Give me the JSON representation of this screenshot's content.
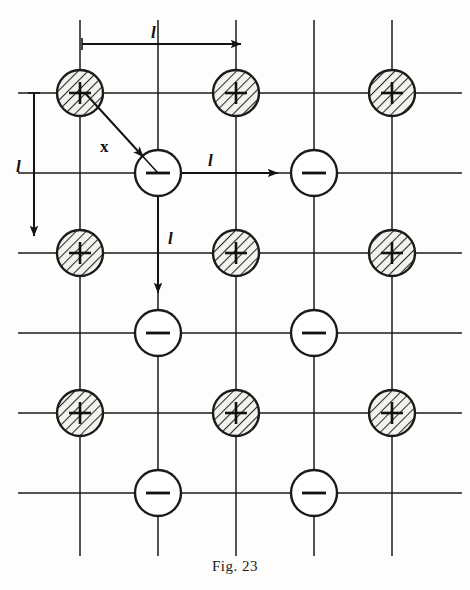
{
  "figure": {
    "caption": "Fig. 23",
    "background_color": "#fdfdfb",
    "line_color": "#1a1a1a",
    "hatch_color": "#2b2b2b",
    "ion_fill_positive": "#e8e8e4",
    "ion_fill_negative": "#ffffff"
  },
  "lattice": {
    "columns_x": [
      80,
      158,
      236,
      314,
      392
    ],
    "rows_y": [
      93,
      173,
      253,
      333,
      413,
      493
    ],
    "spacing_label": "l",
    "circle_radius": 23,
    "ions": [
      {
        "col": 0,
        "row": 0,
        "charge": "+",
        "symbol": "+",
        "shaded": true
      },
      {
        "col": 2,
        "row": 0,
        "charge": "+",
        "symbol": "+",
        "shaded": true
      },
      {
        "col": 4,
        "row": 0,
        "charge": "+",
        "symbol": "+",
        "shaded": true
      },
      {
        "col": 1,
        "row": 1,
        "charge": "-",
        "symbol": "−",
        "shaded": false
      },
      {
        "col": 3,
        "row": 1,
        "charge": "-",
        "symbol": "−",
        "shaded": false
      },
      {
        "col": 0,
        "row": 2,
        "charge": "+",
        "symbol": "+",
        "shaded": true
      },
      {
        "col": 2,
        "row": 2,
        "charge": "+",
        "symbol": "+",
        "shaded": true
      },
      {
        "col": 4,
        "row": 2,
        "charge": "+",
        "symbol": "+",
        "shaded": true
      },
      {
        "col": 1,
        "row": 3,
        "charge": "-",
        "symbol": "−",
        "shaded": false
      },
      {
        "col": 3,
        "row": 3,
        "charge": "-",
        "symbol": "−",
        "shaded": false
      },
      {
        "col": 0,
        "row": 4,
        "charge": "+",
        "symbol": "+",
        "shaded": true
      },
      {
        "col": 2,
        "row": 4,
        "charge": "+",
        "symbol": "+",
        "shaded": true
      },
      {
        "col": 4,
        "row": 4,
        "charge": "+",
        "symbol": "+",
        "shaded": true
      },
      {
        "col": 1,
        "row": 5,
        "charge": "-",
        "symbol": "−",
        "shaded": false
      },
      {
        "col": 3,
        "row": 5,
        "charge": "-",
        "symbol": "−",
        "shaded": false
      }
    ]
  },
  "annotations": {
    "top_arrow": {
      "label": "l",
      "label_x": 151,
      "label_y": 24,
      "x1": 82,
      "y1": 44,
      "x2": 241,
      "y2": 44,
      "direction": "right"
    },
    "left_arrow": {
      "label": "l",
      "label_x": 16,
      "label_y": 158,
      "x1": 34,
      "y1": 93,
      "x2": 34,
      "y2": 236,
      "direction": "down"
    },
    "middle_right_arrow": {
      "label": "l",
      "label_x": 208,
      "label_y": 152,
      "x1": 182,
      "y1": 173,
      "x2": 278,
      "y2": 173,
      "direction": "right"
    },
    "middle_down_arrow": {
      "label": "l",
      "label_x": 168,
      "label_y": 230,
      "x1": 158,
      "y1": 197,
      "x2": 158,
      "y2": 293,
      "direction": "down"
    },
    "diagonal_vector": {
      "label": "x",
      "label_x": 100,
      "label_y": 138,
      "x1": 85,
      "y1": 93,
      "x2": 158,
      "y2": 173,
      "direction": "down-right"
    }
  }
}
